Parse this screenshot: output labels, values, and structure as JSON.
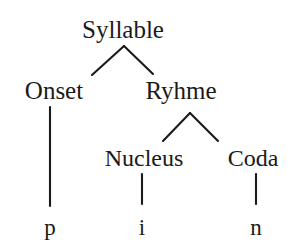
{
  "diagram": {
    "type": "syllable-structure-tree",
    "title": "Syllable",
    "word": "pin",
    "line_color": "#1a1a1a",
    "text_color": "#1a1a1a",
    "background_color": "#ffffff",
    "nodes": {
      "syllable": {
        "label": "Syllable",
        "x": 123,
        "y": 36
      },
      "onset": {
        "label": "Onset",
        "x": 54,
        "y": 97
      },
      "ryhme": {
        "label": "Ryhme",
        "x": 181,
        "y": 97
      },
      "nucleus": {
        "label": "Nucleus",
        "x": 144,
        "y": 165
      },
      "coda": {
        "label": "Coda",
        "x": 253,
        "y": 165
      },
      "terminal_p": {
        "label": "p",
        "x": 50,
        "y": 233
      },
      "terminal_i": {
        "label": "i",
        "x": 142,
        "y": 233
      },
      "terminal_n": {
        "label": "n",
        "x": 256,
        "y": 233
      }
    },
    "edges": [
      {
        "name": "syllable-to-onset",
        "from": "syllable",
        "to": "onset",
        "x1": 124,
        "y1": 46,
        "x2": 92,
        "y2": 75
      },
      {
        "name": "syllable-to-ryhme",
        "from": "syllable",
        "to": "ryhme",
        "x1": 124,
        "y1": 46,
        "x2": 153,
        "y2": 74
      },
      {
        "name": "onset-to-p",
        "from": "onset",
        "to": "terminal_p",
        "x1": 50,
        "y1": 107,
        "x2": 50,
        "y2": 206
      },
      {
        "name": "ryhme-to-nucleus",
        "from": "ryhme",
        "to": "nucleus",
        "x1": 190,
        "y1": 113,
        "x2": 163,
        "y2": 141
      },
      {
        "name": "ryhme-to-coda",
        "from": "ryhme",
        "to": "coda",
        "x1": 190,
        "y1": 113,
        "x2": 218,
        "y2": 141
      },
      {
        "name": "nucleus-to-i",
        "from": "nucleus",
        "to": "terminal_i",
        "x1": 142,
        "y1": 174,
        "x2": 142,
        "y2": 204
      },
      {
        "name": "coda-to-n",
        "from": "coda",
        "to": "terminal_n",
        "x1": 256,
        "y1": 174,
        "x2": 256,
        "y2": 204
      }
    ]
  }
}
